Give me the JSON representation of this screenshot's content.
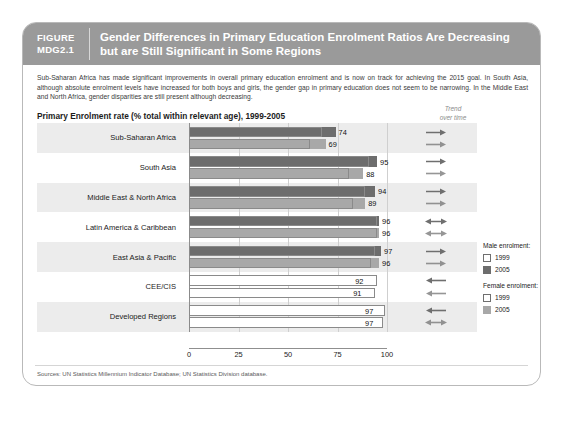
{
  "figure": {
    "label_line1": "FIGURE",
    "label_line2": "MDG2.1",
    "title_line1": "Gender Differences in Primary Education Enrolment Ratios Are Decreasing",
    "title_line2": "but are Still Significant in Some Regions"
  },
  "intro": "Sub-Saharan Africa has made significant improvements in overall primary education enrolment and is now on track for achieving the 2015 goal. In South Asia, although absolute enrolment levels have increased for both boys and girls, the gender gap in primary education does not seem to be narrowing. In the Middle East and North Africa, gender disparities are still present although decreasing.",
  "trend_header": {
    "line1": "Trend",
    "line2": "over time"
  },
  "legend": {
    "male_heading": "Male enrolment:",
    "female_heading": "Female enrolment:",
    "male_1999": "1999",
    "male_2005": "2005",
    "female_1999": "1999",
    "female_2005": "2005"
  },
  "source": "Sources: UN Statistics Millennium Indicator Database; UN Statistics Division database.",
  "colors": {
    "header_band": "#9a9a9a",
    "male_2005": "#6d6d6d",
    "female_2005": "#a8a8a8",
    "outline_1999": "#8a8a8a",
    "row_alt": "#ececec",
    "card_border": "#b9b9b9"
  },
  "chart_data": {
    "type": "bar",
    "orientation": "horizontal",
    "title": "Primary Enrolment rate (% total within relevant age), 1999-2005",
    "xlabel": "",
    "ylabel": "",
    "xlim": [
      0,
      100
    ],
    "ticks": [
      0,
      25,
      50,
      75,
      100
    ],
    "grid": true,
    "legend_position": "right",
    "categories": [
      "Sub-Saharan Africa",
      "South Asia",
      "Middle East & North Africa",
      "Latin America & Caribbean",
      "East Asia & Pacific",
      "CEE/CIS",
      "Developed Regions"
    ],
    "series": [
      {
        "name": "Male enrolment 2005",
        "values": [
          74,
          95,
          94,
          96,
          97,
          92,
          97
        ]
      },
      {
        "name": "Male enrolment 1999",
        "values": [
          67,
          91,
          89,
          95,
          94,
          95,
          99
        ]
      },
      {
        "name": "Female enrolment 2005",
        "values": [
          69,
          88,
          89,
          96,
          96,
          91,
          97
        ]
      },
      {
        "name": "Female enrolment 1999",
        "values": [
          61,
          81,
          83,
          95,
          92,
          94,
          98
        ]
      }
    ],
    "rows": [
      {
        "label": "Sub-Saharan Africa",
        "male": {
          "v2005": 74,
          "v1999": 67,
          "trend": "right"
        },
        "female": {
          "v2005": 69,
          "v1999": 61,
          "trend": "right"
        }
      },
      {
        "label": "South Asia",
        "male": {
          "v2005": 95,
          "v1999": 91,
          "trend": "right"
        },
        "female": {
          "v2005": 88,
          "v1999": 81,
          "trend": "right"
        }
      },
      {
        "label": "Middle East & North Africa",
        "male": {
          "v2005": 94,
          "v1999": 89,
          "trend": "right"
        },
        "female": {
          "v2005": 89,
          "v1999": 83,
          "trend": "right"
        }
      },
      {
        "label": "Latin America & Caribbean",
        "male": {
          "v2005": 96,
          "v1999": 95,
          "trend": "both"
        },
        "female": {
          "v2005": 96,
          "v1999": 95,
          "trend": "both"
        }
      },
      {
        "label": "East Asia & Pacific",
        "male": {
          "v2005": 97,
          "v1999": 94,
          "trend": "right"
        },
        "female": {
          "v2005": 96,
          "v1999": 92,
          "trend": "right"
        }
      },
      {
        "label": "CEE/CIS",
        "male": {
          "v2005": 92,
          "v1999": 95,
          "trend": "left"
        },
        "female": {
          "v2005": 91,
          "v1999": 94,
          "trend": "left"
        }
      },
      {
        "label": "Developed Regions",
        "male": {
          "v2005": 97,
          "v1999": 99,
          "trend": "left"
        },
        "female": {
          "v2005": 97,
          "v1999": 98,
          "trend": "both"
        }
      }
    ]
  }
}
